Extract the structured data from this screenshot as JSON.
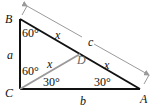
{
  "diagram": {
    "type": "right-triangle",
    "vertices": {
      "B": "B",
      "C": "C",
      "A": "A",
      "D": "D"
    },
    "sides": {
      "BC": "a",
      "CA": "b",
      "BA_dimension": "c",
      "BD": "x",
      "DA": "x",
      "CD": "x"
    },
    "angles": {
      "angle_B": "60°",
      "angle_BCD": "60°",
      "angle_DCA": "30°",
      "angle_A": "30°"
    },
    "colors": {
      "triangle_stroke": "#111111",
      "segment_CD": "#9a9a9a",
      "dimension_arrow": "#9a9a9a",
      "label_D": "#666666"
    }
  }
}
